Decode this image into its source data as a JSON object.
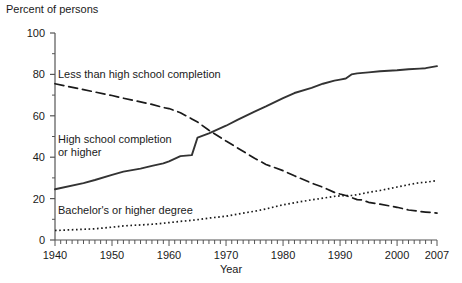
{
  "chart_data": {
    "type": "line",
    "title": "",
    "ylabel": "Percent of persons",
    "xlabel": "Year",
    "xlim": [
      1940,
      2007
    ],
    "ylim": [
      0,
      100
    ],
    "grid": false,
    "legend_position": "inline-annotations",
    "ytick_labels": [
      "0",
      "20",
      "40",
      "60",
      "80",
      "100"
    ],
    "ytick_values": [
      0,
      20,
      40,
      60,
      80,
      100
    ],
    "xtick_labels": [
      "1940",
      "1950",
      "1960",
      "1970",
      "1980",
      "1990",
      "2000",
      "2007"
    ],
    "xtick_values": [
      1940,
      1950,
      1960,
      1970,
      1980,
      1990,
      2000,
      2007
    ],
    "minor_xticks_interval": 1,
    "series": [
      {
        "name": "Less than high school completion",
        "style": "dashed",
        "color": "#1a1a1a",
        "x": [
          1940,
          1947,
          1950,
          1952,
          1957,
          1959,
          1960,
          1962,
          1964,
          1965,
          1967,
          1970,
          1972,
          1975,
          1977,
          1980,
          1982,
          1985,
          1987,
          1989,
          1990,
          1991,
          1992,
          1993,
          1994,
          1995,
          1997,
          2000,
          2002,
          2004,
          2005,
          2007
        ],
        "values": [
          75.5,
          71.5,
          69.8,
          68.5,
          65.5,
          64.0,
          63.5,
          61.5,
          58.5,
          57.0,
          53.0,
          47.8,
          44.5,
          39.5,
          36.5,
          33.5,
          31.0,
          27.5,
          25.5,
          23.0,
          22.2,
          21.5,
          20.5,
          19.5,
          19.3,
          18.2,
          17.3,
          15.8,
          14.5,
          13.8,
          13.5,
          13.0
        ]
      },
      {
        "name": "High school completion or higher",
        "style": "solid",
        "color": "#333333",
        "x": [
          1940,
          1945,
          1947,
          1950,
          1952,
          1955,
          1957,
          1959,
          1960,
          1962,
          1964,
          1965,
          1967,
          1970,
          1972,
          1975,
          1977,
          1980,
          1982,
          1985,
          1987,
          1989,
          1990,
          1991,
          1992,
          1993,
          1995,
          1997,
          2000,
          2002,
          2004,
          2005,
          2006,
          2007
        ],
        "values": [
          24.5,
          27.5,
          29.0,
          31.5,
          33.0,
          34.5,
          35.8,
          37.0,
          38.0,
          40.5,
          41.0,
          49.5,
          51.5,
          55.2,
          58.0,
          62.0,
          64.5,
          68.5,
          71.0,
          73.5,
          75.5,
          77.0,
          77.5,
          78.0,
          80.0,
          80.5,
          81.0,
          81.5,
          82.0,
          82.5,
          82.8,
          83.0,
          83.5,
          84.0
        ]
      },
      {
        "name": "Bachelor's or higher degree",
        "style": "dotted",
        "color": "#1a1a1a",
        "x": [
          1940,
          1947,
          1950,
          1952,
          1957,
          1959,
          1960,
          1962,
          1964,
          1965,
          1967,
          1970,
          1972,
          1975,
          1977,
          1980,
          1982,
          1985,
          1987,
          1989,
          1990,
          1991,
          1992,
          1993,
          1995,
          1997,
          2000,
          2002,
          2004,
          2005,
          2007
        ],
        "values": [
          4.6,
          5.4,
          6.2,
          6.8,
          7.6,
          8.1,
          8.4,
          9.0,
          9.5,
          9.8,
          10.6,
          11.5,
          12.5,
          13.9,
          15.0,
          17.0,
          18.0,
          19.4,
          20.2,
          21.1,
          21.3,
          21.5,
          21.5,
          21.9,
          23.0,
          23.9,
          25.6,
          26.7,
          27.7,
          27.9,
          28.7
        ]
      }
    ],
    "annotations": [
      {
        "text": "Less than high school completion",
        "x": 1941,
        "y": 80
      },
      {
        "text": "High school completion",
        "x": 1941,
        "y": 48
      },
      {
        "text": "or higher",
        "x": 1941,
        "y": 43
      },
      {
        "text": "Bachelor's or higher degree",
        "x": 1941,
        "y": 16
      }
    ]
  }
}
